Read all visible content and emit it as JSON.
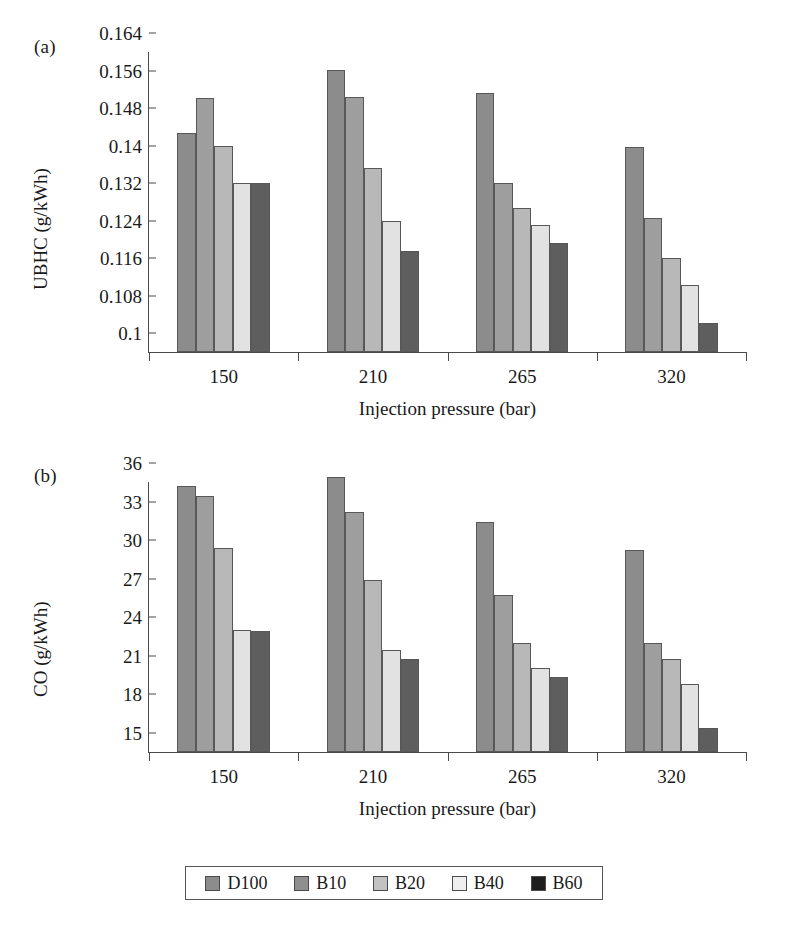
{
  "figure": {
    "legend": {
      "entries": [
        {
          "label": "D100",
          "color": "#8c8c8c",
          "legend_color": "#8c8c8c"
        },
        {
          "label": "B10",
          "color": "#9e9e9e",
          "legend_color": "#8f8f8f"
        },
        {
          "label": "B20",
          "color": "#b8b8b8",
          "legend_color": "#c2c2c2"
        },
        {
          "label": "B40",
          "color": "#e2e2e2",
          "legend_color": "#efefef"
        },
        {
          "label": "B60",
          "color": "#5e5e5e",
          "legend_color": "#1e1e1e"
        }
      ]
    }
  },
  "chart_data": [
    {
      "id": "panel-a",
      "panel_label": "(a)",
      "type": "bar",
      "title": "",
      "xlabel": "Injection pressure (bar)",
      "ylabel": "UBHC (g/kWh)",
      "categories": [
        "150",
        "210",
        "265",
        "320"
      ],
      "ylim": [
        0.1,
        0.164
      ],
      "yticks": [
        "0.1",
        "0.108",
        "0.116",
        "0.124",
        "0.132",
        "0.14",
        "0.148",
        "0.156",
        "0.164"
      ],
      "ytick_values": [
        0.1,
        0.108,
        0.116,
        0.124,
        0.132,
        0.14,
        0.148,
        0.156,
        0.164
      ],
      "grid": false,
      "legend_position": "bottom",
      "series": [
        {
          "name": "D100",
          "values": [
            0.1468,
            0.1602,
            0.1552,
            0.1437
          ]
        },
        {
          "name": "B10",
          "values": [
            0.1542,
            0.1543,
            0.136,
            0.1285
          ]
        },
        {
          "name": "B20",
          "values": [
            0.144,
            0.1392,
            0.1308,
            0.12
          ]
        },
        {
          "name": "B40",
          "values": [
            0.136,
            0.128,
            0.1272,
            0.1142
          ]
        },
        {
          "name": "B60",
          "values": [
            0.136,
            0.1215,
            0.1232,
            0.1062
          ]
        }
      ]
    },
    {
      "id": "panel-b",
      "panel_label": "(b)",
      "type": "bar",
      "title": "",
      "xlabel": "Injection pressure (bar)",
      "ylabel": "CO (g/kWh)",
      "categories": [
        "150",
        "210",
        "265",
        "320"
      ],
      "ylim": [
        15,
        36
      ],
      "yticks": [
        "15",
        "18",
        "21",
        "24",
        "27",
        "30",
        "33",
        "36"
      ],
      "ytick_values": [
        15,
        18,
        21,
        24,
        27,
        30,
        33,
        36
      ],
      "grid": false,
      "legend_position": "bottom",
      "series": [
        {
          "name": "D100",
          "values": [
            35.7,
            36.4,
            32.9,
            30.7
          ]
        },
        {
          "name": "B10",
          "values": [
            34.9,
            33.7,
            27.2,
            23.5
          ]
        },
        {
          "name": "B20",
          "values": [
            30.9,
            28.4,
            23.5,
            22.2
          ]
        },
        {
          "name": "B40",
          "values": [
            24.5,
            22.9,
            21.5,
            20.3
          ]
        },
        {
          "name": "B60",
          "values": [
            24.4,
            22.2,
            20.8,
            16.9
          ]
        }
      ]
    }
  ]
}
